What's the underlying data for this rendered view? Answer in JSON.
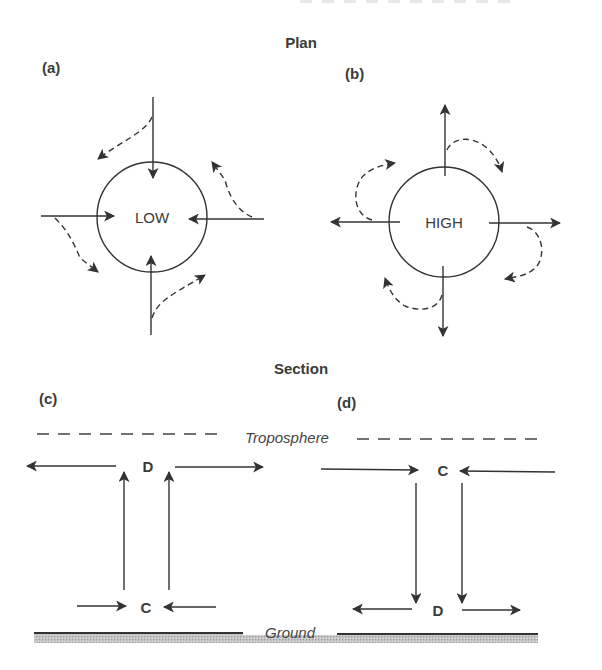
{
  "figure": {
    "plan_title": "Plan",
    "section_title": "Section",
    "panels": {
      "a": {
        "label": "(a)",
        "center_label": "LOW",
        "flow": "inward (convergence)",
        "deflection": "counter-clockwise"
      },
      "b": {
        "label": "(b)",
        "center_label": "HIGH",
        "flow": "outward (divergence)",
        "deflection": "clockwise"
      },
      "c": {
        "label": "(c)",
        "top_label": "D",
        "bottom_label": "C",
        "vertical_motion": "rising"
      },
      "d": {
        "label": "(d)",
        "top_label": "C",
        "bottom_label": "D",
        "vertical_motion": "sinking"
      }
    },
    "layers": {
      "upper": "Troposphere",
      "lower": "Ground"
    },
    "colors": {
      "ink": "#333333",
      "ground_shade": "#b8b8b8",
      "background": "#ffffff"
    }
  }
}
